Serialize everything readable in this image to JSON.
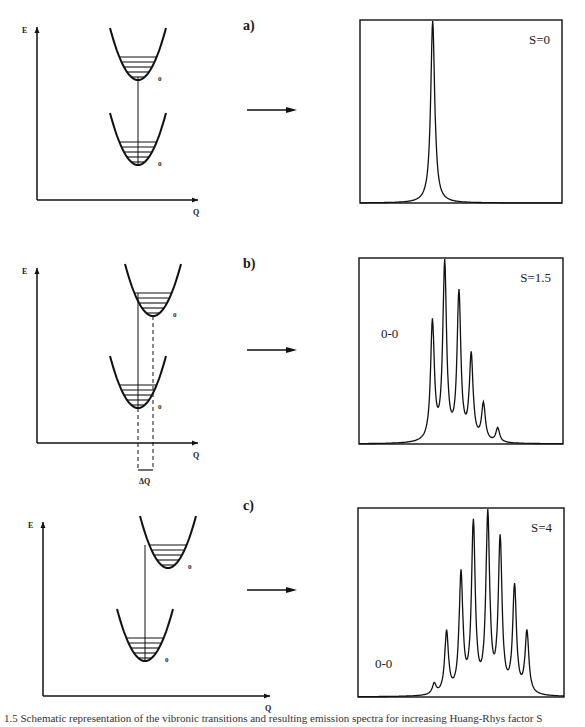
{
  "figure": {
    "axis_labels": {
      "y": "E",
      "x": "Q"
    },
    "level_label": "0",
    "delta_q_label": "ΔQ",
    "caption": "1.5 Schematic representation of the vibronic transitions and resulting emission spectra for increasing Huang-Rhys factor S"
  },
  "panels": [
    {
      "id": "a",
      "label": "a)",
      "s_label": "S=0",
      "zero_zero_label": "",
      "displacement": 0
    },
    {
      "id": "b",
      "label": "b)",
      "s_label": "S=1.5",
      "zero_zero_label": "0-0",
      "displacement": 1
    },
    {
      "id": "c",
      "label": "c)",
      "s_label": "S=4",
      "zero_zero_label": "0-0",
      "displacement": 2
    }
  ],
  "chart_data": [
    {
      "type": "line",
      "title": "S=0",
      "xlabel": "",
      "ylabel": "",
      "grid": false,
      "description": "Single sharp Lorentzian line (pure 0-0 transition)",
      "peaks": [
        {
          "position": 0.36,
          "height": 1.0
        }
      ]
    },
    {
      "type": "line",
      "title": "S=1.5",
      "annotations": [
        "0-0"
      ],
      "grid": false,
      "description": "Vibronic progression, max at 1st replica",
      "peaks": [
        {
          "position": 0.36,
          "height": 0.67
        },
        {
          "position": 0.42,
          "height": 1.0
        },
        {
          "position": 0.49,
          "height": 0.83
        },
        {
          "position": 0.55,
          "height": 0.48
        },
        {
          "position": 0.61,
          "height": 0.21
        },
        {
          "position": 0.68,
          "height": 0.08
        }
      ]
    },
    {
      "type": "line",
      "title": "S=4",
      "annotations": [
        "0-0"
      ],
      "grid": false,
      "description": "Broad vibronic progression, max near 4th replica",
      "peaks": [
        {
          "position": 0.37,
          "height": 0.06
        },
        {
          "position": 0.43,
          "height": 0.35
        },
        {
          "position": 0.5,
          "height": 0.67
        },
        {
          "position": 0.56,
          "height": 0.95
        },
        {
          "position": 0.63,
          "height": 1.0
        },
        {
          "position": 0.69,
          "height": 0.86
        },
        {
          "position": 0.76,
          "height": 0.6
        },
        {
          "position": 0.82,
          "height": 0.35
        }
      ]
    }
  ]
}
